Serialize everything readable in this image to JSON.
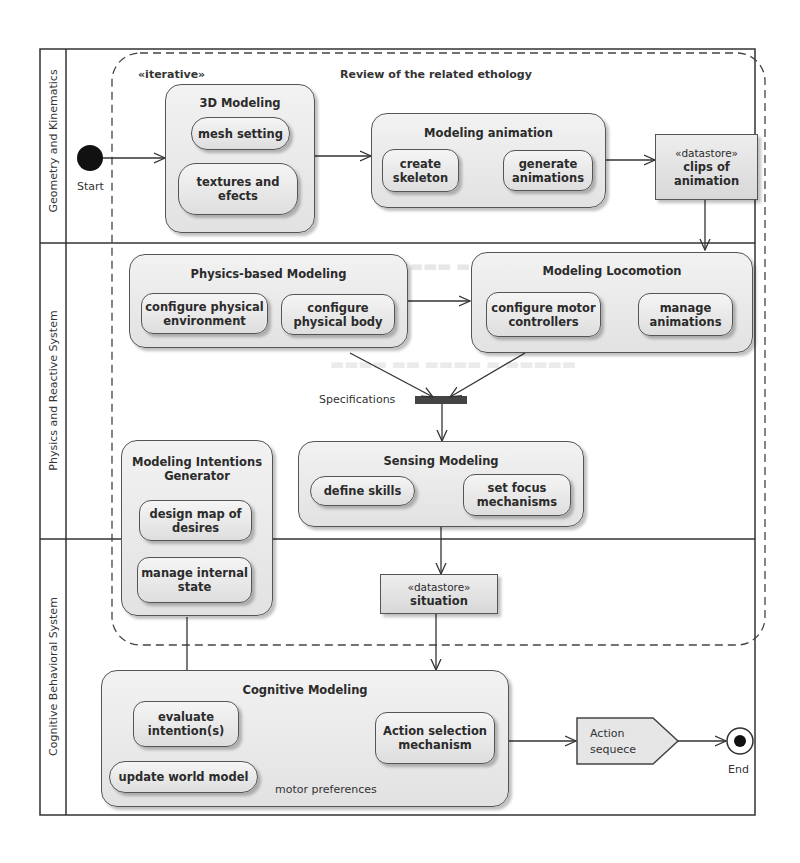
{
  "diagram": {
    "type": "UML activity diagram",
    "frame_label": "Review of the related ethology",
    "frame_stereotype": "«iterative»",
    "lanes": [
      {
        "id": "geometry",
        "title": "Geometry and Kinematics"
      },
      {
        "id": "physics",
        "title": "Physics and Reactive System"
      },
      {
        "id": "cognitive",
        "title": "Cognitive Behavioral System"
      }
    ],
    "start": {
      "label": "Start"
    },
    "end": {
      "label": "End"
    },
    "groups": {
      "modeling3d": {
        "title": "3D Modeling",
        "actions": [
          "mesh setting",
          "textures and efects"
        ]
      },
      "animation": {
        "title": "Modeling animation",
        "actions": [
          "create skeleton",
          "generate animations"
        ]
      },
      "physics": {
        "title": "Physics-based Modeling",
        "actions": [
          "configure physical environment",
          "configure physical body"
        ]
      },
      "locomotion": {
        "title": "Modeling Locomotion",
        "actions": [
          "configure motor controllers",
          "manage animations"
        ]
      },
      "intentions": {
        "title": "Modeling Intentions Generator",
        "actions": [
          "design map of desires",
          "manage internal state"
        ]
      },
      "sensing": {
        "title": "Sensing Modeling",
        "actions": [
          "define skills",
          "set focus mechanisms"
        ]
      },
      "cognitive": {
        "title": "Cognitive Modeling",
        "actions": [
          "evaluate intention(s)",
          "update world model",
          "Action selection mechanism"
        ]
      }
    },
    "datastores": {
      "clips": {
        "stereotype": "«datastore»",
        "name": "clips of animation"
      },
      "situation": {
        "stereotype": "«datastore»",
        "name": "situation"
      }
    },
    "joins": {
      "specifications": {
        "label": "Specifications"
      },
      "motor": {
        "label": "motor preferences"
      }
    },
    "signal": {
      "label": "Action sequece"
    },
    "flows": [
      [
        "Start",
        "3D Modeling"
      ],
      [
        "3D Modeling",
        "Modeling animation"
      ],
      [
        "create skeleton",
        "generate animations"
      ],
      [
        "Modeling animation",
        "clips of animation"
      ],
      [
        "clips of animation",
        "Modeling Locomotion"
      ],
      [
        "Physics-based Modeling",
        "Modeling Locomotion"
      ],
      [
        "Physics-based Modeling",
        "Specifications"
      ],
      [
        "Modeling Locomotion",
        "Specifications"
      ],
      [
        "Specifications",
        "Sensing Modeling"
      ],
      [
        "define skills",
        "set focus mechanisms"
      ],
      [
        "Sensing Modeling",
        "situation"
      ],
      [
        "situation",
        "Cognitive Modeling"
      ],
      [
        "Modeling Intentions Generator",
        "evaluate intention(s)"
      ],
      [
        "evaluate intention(s)",
        "motor preferences"
      ],
      [
        "update world model",
        "motor preferences"
      ],
      [
        "motor preferences",
        "Action selection mechanism"
      ],
      [
        "Cognitive Modeling",
        "Action sequece"
      ],
      [
        "Action sequece",
        "End"
      ]
    ]
  }
}
